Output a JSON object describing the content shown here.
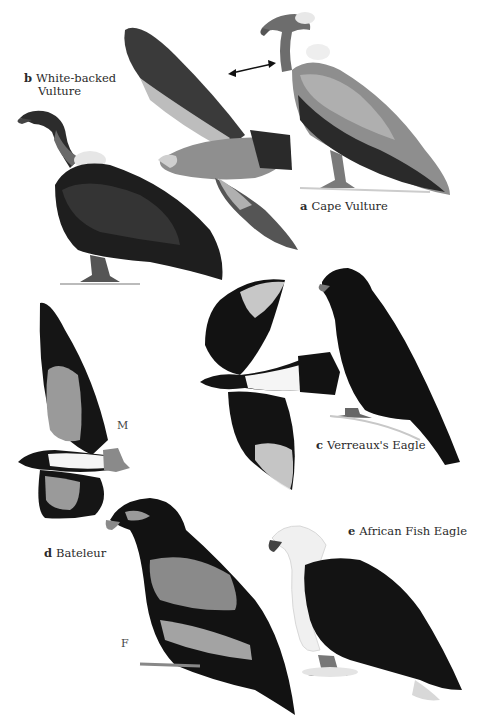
{
  "plate": {
    "style": "grayscale field-guide illustration",
    "background": "#ffffff"
  },
  "species": [
    {
      "letter": "a",
      "name": "Cape Vulture"
    },
    {
      "letter": "b",
      "name_line1": "White-backed",
      "name_line2": "Vulture"
    },
    {
      "letter": "c",
      "name": "Verreaux's Eagle"
    },
    {
      "letter": "d",
      "name": "Bateleur"
    },
    {
      "letter": "e",
      "name": "African Fish Eagle"
    }
  ],
  "sex_marks": {
    "male": "M",
    "female": "F"
  },
  "icons": {
    "comparison_arrow": "double-headed-arrow"
  },
  "colors": {
    "dark_plumage": "#151515",
    "mid_gray": "#7a7a7a",
    "light_gray": "#b5b5b5",
    "white_patch": "#f2f2f2"
  }
}
